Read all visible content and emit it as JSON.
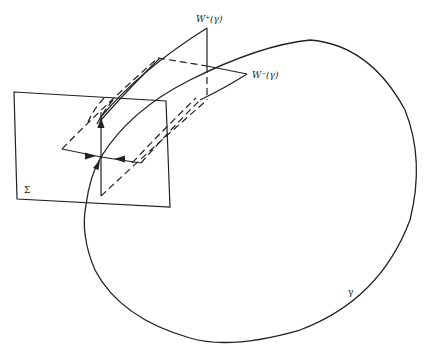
{
  "diagram": {
    "labels": {
      "unstable_manifold": "W⁺(γ)",
      "stable_manifold": "W⁻(γ)",
      "section": "Σ",
      "orbit": "γ"
    },
    "elements": [
      {
        "id": "section-plane",
        "type": "quadrilateral",
        "label": "Σ"
      },
      {
        "id": "unstable-manifold-sheet",
        "type": "curved-strip",
        "label": "W⁺(γ)"
      },
      {
        "id": "stable-manifold-sheet",
        "type": "curved-strip",
        "label": "W⁻(γ)"
      },
      {
        "id": "periodic-orbit",
        "type": "closed-curve",
        "label": "γ"
      },
      {
        "id": "fixed-point",
        "type": "intersection",
        "arrows": [
          "up (outgoing)",
          "left-in",
          "right-in",
          "orbit-in"
        ]
      }
    ],
    "stroke_color": "#222222",
    "background": "#ffffff"
  }
}
